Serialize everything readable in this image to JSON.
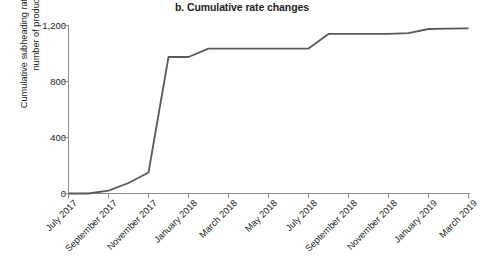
{
  "title": "b. Cumulative rate changes",
  "axes": {
    "ylabel_line1": "Cumulative subheading rate changes,",
    "ylabel_line2": "number of products",
    "yticks": [
      "0",
      "400",
      "800",
      "1,200"
    ],
    "xticks": [
      "July 2017",
      "September 2017",
      "November 2017",
      "January 2018",
      "March 2018",
      "May 2018",
      "July 2018",
      "September 2018",
      "November 2018",
      "January 2019",
      "March 2019"
    ]
  },
  "style": {
    "line_color": "#5a5a5a",
    "axis_color": "#8c8c8c",
    "text_color": "#231f20"
  },
  "chart_data": {
    "type": "line",
    "title": "b. Cumulative rate changes",
    "xlabel": "",
    "ylabel": "Cumulative subheading rate changes, number of products",
    "ylim": [
      0,
      1200
    ],
    "yticks": [
      0,
      400,
      800,
      1200
    ],
    "grid": false,
    "legend": "none",
    "categories": [
      "July 2017",
      "August 2017",
      "September 2017",
      "October 2017",
      "November 2017",
      "December 2017",
      "January 2018",
      "February 2018",
      "March 2018",
      "April 2018",
      "May 2018",
      "June 2018",
      "July 2018",
      "August 2018",
      "September 2018",
      "October 2018",
      "November 2018",
      "December 2018",
      "January 2019",
      "February 2019",
      "March 2019"
    ],
    "series": [
      {
        "name": "Cumulative subheading rate changes",
        "values": [
          0,
          0,
          20,
          75,
          150,
          975,
          975,
          1035,
          1035,
          1035,
          1035,
          1035,
          1035,
          1140,
          1140,
          1140,
          1140,
          1145,
          1175,
          1178,
          1180
        ]
      }
    ]
  }
}
